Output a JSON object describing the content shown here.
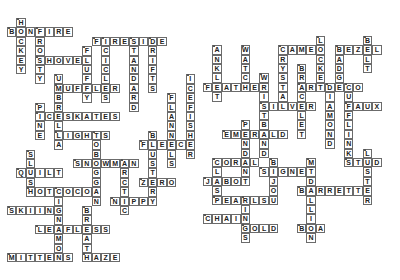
{
  "puzzle": {
    "cell_size": 9.4,
    "clusters": [
      {
        "name": "winter",
        "origin": {
          "x": 7,
          "y": 18
        },
        "words": [
          {
            "word": "HOCKEY",
            "col": 1,
            "row": 0,
            "dir": "down"
          },
          {
            "word": "BONFIRE",
            "col": 0,
            "row": 1,
            "dir": "across"
          },
          {
            "word": "FROSTY",
            "col": 3,
            "row": 1,
            "dir": "down"
          },
          {
            "word": "SHOVEL",
            "col": 3,
            "row": 4,
            "dir": "across"
          },
          {
            "word": "FLUFFY",
            "col": 8,
            "row": 3,
            "dir": "down"
          },
          {
            "word": "FIRESIDE",
            "col": 9,
            "row": 2,
            "dir": "across"
          },
          {
            "word": "ICICLES",
            "col": 10,
            "row": 2,
            "dir": "down"
          },
          {
            "word": "STANDARD",
            "col": 13,
            "row": 2,
            "dir": "down"
          },
          {
            "word": "DRIFTS",
            "col": 15,
            "row": 2,
            "dir": "down"
          },
          {
            "word": "MUFFLER",
            "col": 5,
            "row": 7,
            "dir": "across"
          },
          {
            "word": "UMBRELLA",
            "col": 5,
            "row": 6,
            "dir": "down"
          },
          {
            "word": "PINE",
            "col": 3,
            "row": 9,
            "dir": "down"
          },
          {
            "word": "ICESKATES",
            "col": 3,
            "row": 10,
            "dir": "across"
          },
          {
            "word": "LIGHTS",
            "col": 5,
            "row": 12,
            "dir": "across"
          },
          {
            "word": "TOBOGGAN",
            "col": 9,
            "row": 12,
            "dir": "down"
          },
          {
            "word": "SNOWMAN",
            "col": 7,
            "row": 15,
            "dir": "across"
          },
          {
            "word": "ARCTIC",
            "col": 12,
            "row": 15,
            "dir": "down"
          },
          {
            "word": "SLUSH",
            "col": 2,
            "row": 14,
            "dir": "down"
          },
          {
            "word": "QUILT",
            "col": 1,
            "row": 16,
            "dir": "across"
          },
          {
            "word": "HOTCOCOA",
            "col": 2,
            "row": 18,
            "dir": "across"
          },
          {
            "word": "NIPPY",
            "col": 11,
            "row": 19,
            "dir": "across"
          },
          {
            "word": "BLUSTERY",
            "col": 15,
            "row": 12,
            "dir": "down"
          },
          {
            "word": "FLEECE",
            "col": 14,
            "row": 13,
            "dir": "across"
          },
          {
            "word": "FLANNELS",
            "col": 17,
            "row": 8,
            "dir": "down"
          },
          {
            "word": "ICEFISHER",
            "col": 19,
            "row": 6,
            "dir": "down"
          },
          {
            "word": "ZERO",
            "col": 14,
            "row": 17,
            "dir": "across"
          },
          {
            "word": "CINNAMON",
            "col": 5,
            "row": 18,
            "dir": "down"
          },
          {
            "word": "SKIING",
            "col": 0,
            "row": 20,
            "dir": "across"
          },
          {
            "word": "BREATH",
            "col": 8,
            "row": 20,
            "dir": "down"
          },
          {
            "word": "LEAFLESS",
            "col": 3,
            "row": 22,
            "dir": "across"
          },
          {
            "word": "MITTENS",
            "col": 0,
            "row": 25,
            "dir": "across"
          },
          {
            "word": "HAZE",
            "col": 8,
            "row": 25,
            "dir": "across"
          }
        ]
      },
      {
        "name": "jewelry",
        "origin": {
          "x": 203,
          "y": 17
        },
        "words": [
          {
            "word": "FEATHER",
            "col": 0,
            "row": 7,
            "dir": "across"
          },
          {
            "word": "ANKLET",
            "col": 1,
            "row": 3,
            "dir": "down"
          },
          {
            "word": "WATCH",
            "col": 4,
            "row": 3,
            "dir": "down"
          },
          {
            "word": "WRISTBAND",
            "col": 6,
            "row": 6,
            "dir": "down"
          },
          {
            "word": "SILVER",
            "col": 6,
            "row": 9,
            "dir": "across"
          },
          {
            "word": "CRYSTAL",
            "col": 8,
            "row": 3,
            "dir": "down"
          },
          {
            "word": "CAMEO",
            "col": 8,
            "row": 3,
            "dir": "across"
          },
          {
            "word": "LOCKET",
            "col": 12,
            "row": 2,
            "dir": "down"
          },
          {
            "word": "ARTDECO",
            "col": 10,
            "row": 7,
            "dir": "across"
          },
          {
            "word": "BRACELET",
            "col": 10,
            "row": 5,
            "dir": "down"
          },
          {
            "word": "DIAMOND",
            "col": 13,
            "row": 7,
            "dir": "down"
          },
          {
            "word": "BADGE",
            "col": 14,
            "row": 3,
            "dir": "down"
          },
          {
            "word": "BEZEL",
            "col": 14,
            "row": 3,
            "dir": "across"
          },
          {
            "word": "BELT",
            "col": 17,
            "row": 2,
            "dir": "down"
          },
          {
            "word": "CUFFLINKS",
            "col": 15,
            "row": 7,
            "dir": "down"
          },
          {
            "word": "FAUX",
            "col": 15,
            "row": 9,
            "dir": "across"
          },
          {
            "word": "STUD",
            "col": 15,
            "row": 15,
            "dir": "across"
          },
          {
            "word": "LUSTER",
            "col": 17,
            "row": 14,
            "dir": "down"
          },
          {
            "word": "BARRETTE",
            "col": 10,
            "row": 18,
            "dir": "across"
          },
          {
            "word": "MEDALLION",
            "col": 11,
            "row": 15,
            "dir": "down"
          },
          {
            "word": "SIGNET",
            "col": 6,
            "row": 16,
            "dir": "across"
          },
          {
            "word": "BIJOU",
            "col": 7,
            "row": 15,
            "dir": "down"
          },
          {
            "word": "BOA",
            "col": 10,
            "row": 22,
            "dir": "across"
          },
          {
            "word": "PENDANT",
            "col": 4,
            "row": 11,
            "dir": "down"
          },
          {
            "word": "EMERALD",
            "col": 2,
            "row": 12,
            "dir": "across"
          },
          {
            "word": "CORAL",
            "col": 1,
            "row": 15,
            "dir": "across"
          },
          {
            "word": "CLASP",
            "col": 1,
            "row": 15,
            "dir": "down"
          },
          {
            "word": "JABOT",
            "col": 0,
            "row": 17,
            "dir": "across"
          },
          {
            "word": "PEARLS",
            "col": 1,
            "row": 19,
            "dir": "across"
          },
          {
            "word": "RINGS",
            "col": 4,
            "row": 19,
            "dir": "down"
          },
          {
            "word": "CHAIN",
            "col": 0,
            "row": 21,
            "dir": "across"
          },
          {
            "word": "GOLD",
            "col": 4,
            "row": 22,
            "dir": "across"
          }
        ]
      }
    ]
  },
  "colors": {
    "border": "#6b6b6b",
    "text": "#222222",
    "background": "#ffffff"
  }
}
